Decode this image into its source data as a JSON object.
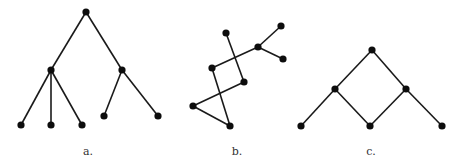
{
  "figure": {
    "width": 462,
    "height": 166,
    "node_radius": 3.6,
    "colors": {
      "edge": "#1a1a1a",
      "node": "#0d0d0d",
      "label": "#333333",
      "background": "#ffffff"
    },
    "diagrams": [
      {
        "id": "a",
        "label": "a.",
        "label_pos": [
          88,
          155
        ],
        "description": "rooted tree",
        "nodes": [
          {
            "id": "a0",
            "x": 86,
            "y": 12
          },
          {
            "id": "a1",
            "x": 51,
            "y": 70
          },
          {
            "id": "a2",
            "x": 122,
            "y": 70
          },
          {
            "id": "a3",
            "x": 21,
            "y": 125
          },
          {
            "id": "a4",
            "x": 51,
            "y": 125
          },
          {
            "id": "a5",
            "x": 82,
            "y": 125
          },
          {
            "id": "a6",
            "x": 104,
            "y": 116
          },
          {
            "id": "a7",
            "x": 158,
            "y": 116
          }
        ],
        "edges": [
          [
            "a0",
            "a1"
          ],
          [
            "a0",
            "a2"
          ],
          [
            "a1",
            "a3"
          ],
          [
            "a1",
            "a4"
          ],
          [
            "a1",
            "a5"
          ],
          [
            "a2",
            "a6"
          ],
          [
            "a2",
            "a7"
          ]
        ]
      },
      {
        "id": "b",
        "label": "b.",
        "label_pos": [
          237,
          155
        ],
        "description": "tree drawn with crossing edges",
        "nodes": [
          {
            "id": "b0",
            "x": 226,
            "y": 33
          },
          {
            "id": "b1",
            "x": 258,
            "y": 47
          },
          {
            "id": "b2",
            "x": 281,
            "y": 26
          },
          {
            "id": "b3",
            "x": 283,
            "y": 59
          },
          {
            "id": "b4",
            "x": 212,
            "y": 68
          },
          {
            "id": "b5",
            "x": 244,
            "y": 82
          },
          {
            "id": "b6",
            "x": 193,
            "y": 106
          },
          {
            "id": "b7",
            "x": 230,
            "y": 126
          }
        ],
        "edges": [
          [
            "b0",
            "b5"
          ],
          [
            "b4",
            "b1"
          ],
          [
            "b1",
            "b2"
          ],
          [
            "b1",
            "b3"
          ],
          [
            "b4",
            "b7"
          ],
          [
            "b5",
            "b6"
          ],
          [
            "b6",
            "b7"
          ]
        ]
      },
      {
        "id": "c",
        "label": "c.",
        "label_pos": [
          371,
          155
        ],
        "description": "graph with a cycle (diamond) plus two pendant leaves",
        "nodes": [
          {
            "id": "c0",
            "x": 372,
            "y": 50
          },
          {
            "id": "c1",
            "x": 335,
            "y": 89
          },
          {
            "id": "c2",
            "x": 406,
            "y": 89
          },
          {
            "id": "c3",
            "x": 301,
            "y": 126
          },
          {
            "id": "c4",
            "x": 370,
            "y": 126
          },
          {
            "id": "c5",
            "x": 442,
            "y": 126
          }
        ],
        "edges": [
          [
            "c0",
            "c1"
          ],
          [
            "c0",
            "c2"
          ],
          [
            "c1",
            "c3"
          ],
          [
            "c1",
            "c4"
          ],
          [
            "c2",
            "c4"
          ],
          [
            "c2",
            "c5"
          ]
        ]
      }
    ]
  }
}
